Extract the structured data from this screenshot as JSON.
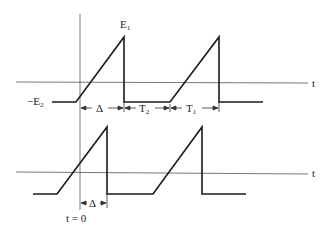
{
  "diagram": {
    "top_waveform": {
      "peak_label": "E",
      "peak_sub": "1",
      "low_label": "−E",
      "low_sub": "2",
      "axis_label": "t",
      "intervals": [
        {
          "label": "Δ",
          "sub": ""
        },
        {
          "label": "T",
          "sub": "2"
        },
        {
          "label": "T",
          "sub": "1"
        }
      ]
    },
    "bottom_waveform": {
      "axis_label": "t",
      "interval": {
        "label": "Δ"
      },
      "origin_label": "t = 0"
    },
    "colors": {
      "line": "#1a1a1a",
      "axis": "#555555"
    }
  }
}
